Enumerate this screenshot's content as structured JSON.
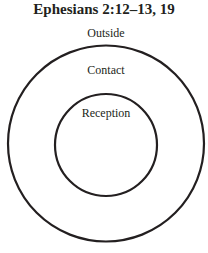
{
  "title": "Ephesians 2:12–13, 19",
  "labels": {
    "outside": "Outside",
    "contact": "Contact",
    "reception": "Reception"
  },
  "colors": {
    "stroke": "#231f20",
    "text": "#231f20",
    "background": "#ffffff"
  }
}
